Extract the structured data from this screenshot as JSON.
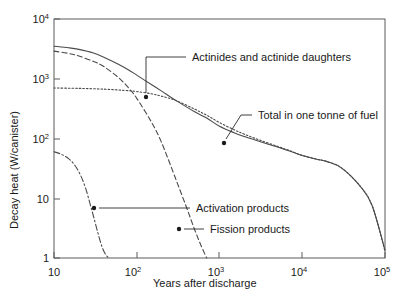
{
  "chart_data": {
    "type": "line",
    "title": "",
    "xlabel": "Years after discharge",
    "ylabel": "Decay heat (W/canister)",
    "xscale": "log",
    "yscale": "log",
    "xlim": [
      10,
      100000
    ],
    "ylim": [
      1,
      10000
    ],
    "grid": false,
    "legend_position": "inline-annotations",
    "xticks": [
      {
        "value": 10,
        "label": "10",
        "exponent": ""
      },
      {
        "value": 100,
        "label": "10",
        "exponent": "2"
      },
      {
        "value": 1000,
        "label": "10",
        "exponent": "3"
      },
      {
        "value": 10000,
        "label": "10",
        "exponent": "4"
      },
      {
        "value": 100000,
        "label": "10",
        "exponent": "5"
      }
    ],
    "yticks": [
      {
        "value": 1,
        "label": "1",
        "exponent": ""
      },
      {
        "value": 10,
        "label": "10",
        "exponent": ""
      },
      {
        "value": 100,
        "label": "10",
        "exponent": "2"
      },
      {
        "value": 1000,
        "label": "10",
        "exponent": "3"
      },
      {
        "value": 10000,
        "label": "10",
        "exponent": "4"
      }
    ],
    "series": [
      {
        "name": "Total in one tonne of fuel",
        "style": "solid",
        "color": "#4a4a4a",
        "x": [
          10,
          15,
          20,
          30,
          40,
          60,
          80,
          100,
          150,
          200,
          300,
          500,
          700,
          1000,
          1500,
          2000,
          3000,
          5000,
          7000,
          10000,
          15000,
          20000,
          30000,
          50000,
          70000,
          100000
        ],
        "y": [
          3500,
          3300,
          3100,
          2700,
          2300,
          1750,
          1400,
          1150,
          800,
          620,
          430,
          280,
          220,
          160,
          125,
          108,
          90,
          72,
          62,
          52,
          45,
          41,
          32,
          16,
          7.5,
          1.35
        ]
      },
      {
        "name": "Fission products",
        "style": "dashed",
        "color": "#4a4a4a",
        "x": [
          10,
          15,
          20,
          30,
          40,
          60,
          80,
          100,
          150,
          200,
          300,
          400,
          500,
          600,
          700
        ],
        "y": [
          2900,
          2650,
          2400,
          1950,
          1600,
          1050,
          700,
          470,
          190,
          85,
          20,
          7.0,
          3.0,
          1.6,
          1.0
        ]
      },
      {
        "name": "Actinides and actinide daughters",
        "style": "dotted",
        "color": "#4a4a4a",
        "x": [
          10,
          20,
          40,
          70,
          100,
          150,
          200,
          300,
          500,
          700,
          1000,
          1500,
          2000,
          3000,
          5000,
          7000,
          10000,
          15000,
          20000,
          30000,
          50000,
          70000,
          100000
        ],
        "y": [
          700,
          690,
          670,
          640,
          610,
          560,
          510,
          430,
          310,
          245,
          185,
          140,
          118,
          95,
          74,
          63,
          52,
          45,
          41,
          32,
          16,
          7.5,
          1.3
        ]
      },
      {
        "name": "Activation products",
        "style": "dashdot",
        "color": "#4a4a4a",
        "x": [
          10,
          12,
          15,
          18,
          21,
          24,
          27,
          30,
          34,
          38,
          42,
          46
        ],
        "y": [
          60,
          55,
          46,
          35,
          24,
          15,
          8.5,
          5.0,
          2.6,
          1.55,
          1.15,
          1.0
        ]
      }
    ],
    "annotations": [
      {
        "id": "actinides",
        "text": "Actinides and actinide daughters",
        "text_x": 192,
        "text_y": 61,
        "leader": "M186,57 L146,57 L146,93",
        "arrow_x": 146,
        "arrow_y": 97
      },
      {
        "id": "total",
        "text": "Total in one tonne of fuel",
        "text_x": 258,
        "text_y": 119,
        "leader": "M252,115 L241,115 L226,139",
        "arrow_x": 224,
        "arrow_y": 143
      },
      {
        "id": "activation",
        "text": "Activation products",
        "text_x": 196,
        "text_y": 212,
        "leader": "M190,208 L99,208",
        "arrow_x": 94,
        "arrow_y": 208
      },
      {
        "id": "fission",
        "text": "Fission products",
        "text_x": 210,
        "text_y": 233,
        "leader": "M204,229 L184,229",
        "arrow_x": 179,
        "arrow_y": 229
      }
    ]
  },
  "plot_geometry": {
    "left": 54,
    "right": 385,
    "top": 19,
    "bottom": 258
  }
}
